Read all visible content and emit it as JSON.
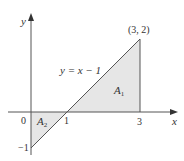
{
  "diagram": {
    "x_axis_label": "x",
    "y_axis_label": "y",
    "origin_label": "0",
    "tick_x1": "1",
    "tick_x3": "3",
    "tick_ym1": "−1",
    "point_label": "(3, 2)",
    "line_label": "y = x − 1",
    "region_a1_main": "A",
    "region_a1_sub": "1",
    "region_a2_main": "A",
    "region_a2_sub": "2",
    "colors": {
      "axis": "#555555",
      "line": "#555555",
      "fill": "#e6e6e6",
      "text": "#333333"
    }
  }
}
